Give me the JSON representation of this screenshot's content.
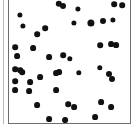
{
  "figure": {
    "title": "",
    "background_color": "#ffffff",
    "panel_border_color": "#6d6d6d",
    "left_rule_color": "#b8b8b8",
    "point_color": "#111111"
  },
  "chart_data": {
    "type": "scatter",
    "title": "",
    "subtitle": "",
    "xlabel": "",
    "ylabel": "",
    "xlim": [
      0,
      123
    ],
    "ylim": [
      0,
      126
    ],
    "grid": false,
    "legend": null,
    "tick_labels_x": [],
    "tick_labels_y": [],
    "annotations": [],
    "marker": "filled-circle",
    "n_points": 44,
    "series": [
      {
        "name": "points",
        "color": "#111111",
        "points": [
          {
            "x": 11,
            "y": 16,
            "r": 2.6
          },
          {
            "x": 14,
            "y": 27,
            "r": 2.6
          },
          {
            "x": 50,
            "y": 5,
            "r": 3.2
          },
          {
            "x": 54,
            "y": 7,
            "r": 3.0
          },
          {
            "x": 69,
            "y": 10,
            "r": 2.6
          },
          {
            "x": 105,
            "y": 5,
            "r": 2.8
          },
          {
            "x": 113,
            "y": 6,
            "r": 2.8
          },
          {
            "x": 94,
            "y": 22,
            "r": 3.0
          },
          {
            "x": 104,
            "y": 21,
            "r": 2.6
          },
          {
            "x": 82,
            "y": 24,
            "r": 3.6
          },
          {
            "x": 65,
            "y": 24,
            "r": 2.6
          },
          {
            "x": 36,
            "y": 29,
            "r": 2.8
          },
          {
            "x": 28,
            "y": 35,
            "r": 2.8
          },
          {
            "x": 6,
            "y": 48,
            "r": 2.8
          },
          {
            "x": 8,
            "y": 57,
            "r": 2.9
          },
          {
            "x": 24,
            "y": 49,
            "r": 2.9
          },
          {
            "x": 91,
            "y": 46,
            "r": 2.8
          },
          {
            "x": 102,
            "y": 45,
            "r": 2.9
          },
          {
            "x": 107,
            "y": 46,
            "r": 2.9
          },
          {
            "x": 40,
            "y": 58,
            "r": 2.9
          },
          {
            "x": 54,
            "y": 56,
            "r": 2.8
          },
          {
            "x": 61,
            "y": 60,
            "r": 2.7
          },
          {
            "x": 50,
            "y": 73,
            "r": 2.9
          },
          {
            "x": 6,
            "y": 70,
            "r": 2.8
          },
          {
            "x": 13,
            "y": 73,
            "r": 2.8
          },
          {
            "x": 91,
            "y": 69,
            "r": 2.7
          },
          {
            "x": 100,
            "y": 75,
            "r": 3.0
          },
          {
            "x": 103,
            "y": 80,
            "r": 3.0
          },
          {
            "x": 11,
            "y": 71,
            "r": 2.8
          },
          {
            "x": 21,
            "y": 83,
            "r": 2.9
          },
          {
            "x": 6,
            "y": 82,
            "r": 2.8
          },
          {
            "x": 31,
            "y": 78,
            "r": 2.9
          },
          {
            "x": 6,
            "y": 91,
            "r": 2.9
          },
          {
            "x": 20,
            "y": 92,
            "r": 2.9
          },
          {
            "x": 47,
            "y": 74,
            "r": 2.9
          },
          {
            "x": 47,
            "y": 91,
            "r": 2.9
          },
          {
            "x": 70,
            "y": 74,
            "r": 2.7
          },
          {
            "x": 28,
            "y": 106,
            "r": 2.9
          },
          {
            "x": 59,
            "y": 105,
            "r": 2.8
          },
          {
            "x": 65,
            "y": 108,
            "r": 2.9
          },
          {
            "x": 92,
            "y": 103,
            "r": 2.9
          },
          {
            "x": 102,
            "y": 108,
            "r": 2.9
          },
          {
            "x": 40,
            "y": 120,
            "r": 2.9
          },
          {
            "x": 56,
            "y": 121,
            "r": 2.9
          },
          {
            "x": 86,
            "y": 118,
            "r": 2.9
          }
        ]
      }
    ]
  }
}
